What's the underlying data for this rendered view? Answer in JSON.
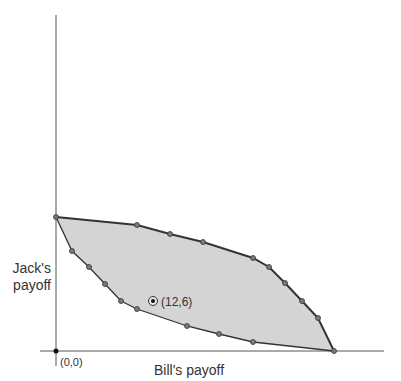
{
  "diagram": {
    "type": "payoff-region",
    "axes": {
      "x_label": "Bill's payoff",
      "y_label_line1": "Jack's",
      "y_label_line2": "payoff",
      "origin_label": "(0,0)"
    },
    "highlighted_point": {
      "label": "(12,6)"
    },
    "colors": {
      "region_fill": "#d4d4d4",
      "boundary_stroke": "#333333",
      "axis_stroke": "#555555",
      "vertex_fill": "#7a7a7a",
      "background": "#ffffff"
    }
  }
}
